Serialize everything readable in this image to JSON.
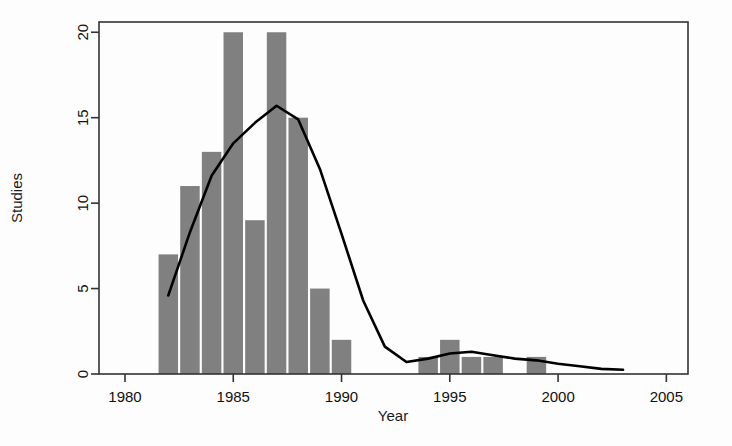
{
  "chart_data": {
    "type": "bar",
    "title": "",
    "xlabel": "Year",
    "ylabel": "Studies",
    "xlim": [
      1978.8,
      2006.0
    ],
    "ylim": [
      0,
      20.6
    ],
    "xticks": [
      1980,
      1985,
      1990,
      1995,
      2000,
      2005
    ],
    "xtick_labels": [
      "1980",
      "1985",
      "1990",
      "1995",
      "2000",
      "2005"
    ],
    "yticks": [
      0,
      5,
      10,
      15,
      20
    ],
    "ytick_labels": [
      "0",
      "5",
      "10",
      "15",
      "20"
    ],
    "grid": false,
    "legend": null,
    "bar_color": "#808080",
    "line_color": "#000000",
    "bar_width_years": 0.9,
    "categories": [
      1982,
      1983,
      1984,
      1985,
      1986,
      1987,
      1988,
      1989,
      1990,
      1991,
      1994,
      1995,
      1996,
      1997,
      1999
    ],
    "values": [
      7,
      11,
      13,
      20,
      9,
      20,
      15,
      5,
      2,
      0,
      1,
      2,
      1,
      1,
      1
    ],
    "series": [
      {
        "name": "Studies per year",
        "type": "bar",
        "categories": [
          1982,
          1983,
          1984,
          1985,
          1986,
          1987,
          1988,
          1989,
          1990,
          1991,
          1994,
          1995,
          1996,
          1997,
          1999
        ],
        "values": [
          7,
          11,
          13,
          20,
          9,
          20,
          15,
          5,
          2,
          0,
          1,
          2,
          1,
          1,
          1
        ]
      },
      {
        "name": "Smoothed trend",
        "type": "line",
        "x": [
          1982.0,
          1983.0,
          1984.0,
          1985.0,
          1986.0,
          1987.0,
          1988.0,
          1989.0,
          1990.0,
          1991.0,
          1992.0,
          1993.0,
          1994.0,
          1995.0,
          1996.0,
          1997.0,
          1998.0,
          1999.0,
          2000.0,
          2001.0,
          2002.0,
          2003.0
        ],
        "y": [
          4.6,
          8.3,
          11.6,
          13.5,
          14.7,
          15.7,
          14.9,
          12.0,
          8.2,
          4.3,
          1.6,
          0.7,
          0.9,
          1.2,
          1.3,
          1.1,
          0.9,
          0.8,
          0.6,
          0.45,
          0.3,
          0.25
        ]
      }
    ]
  },
  "figure": {
    "axis_color": "#333333",
    "background": "#ffffff"
  }
}
